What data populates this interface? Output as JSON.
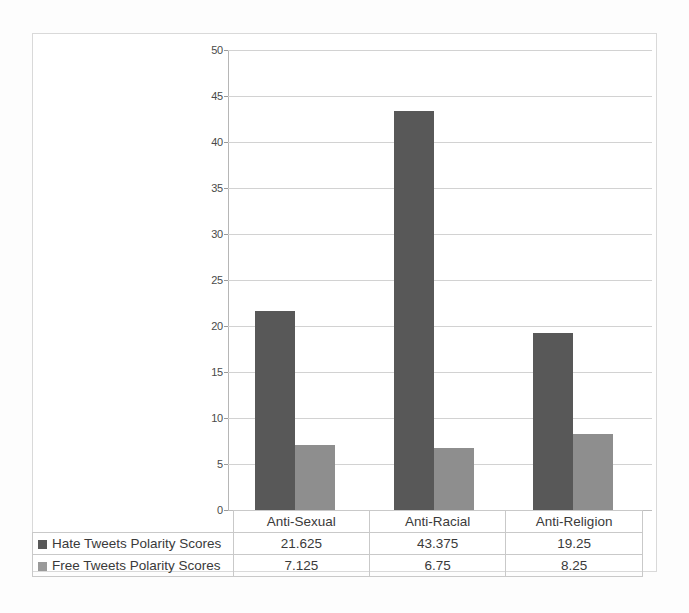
{
  "chart_data": {
    "type": "bar",
    "title": "",
    "xlabel": "",
    "ylabel": "",
    "ylim": [
      0,
      50
    ],
    "yticks": [
      0,
      5,
      10,
      15,
      20,
      25,
      30,
      35,
      40,
      45,
      50
    ],
    "grid": true,
    "legend_position": "bottom-table",
    "categories": [
      "Anti-Sexual",
      "Anti-Racial",
      "Anti-Religion"
    ],
    "series": [
      {
        "name": "Hate Tweets Polarity Scores",
        "color": "#585858",
        "values": [
          21.625,
          43.375,
          19.25
        ],
        "value_labels": [
          "21.625",
          "43.375",
          "19.25"
        ]
      },
      {
        "name": "Free Tweets Polarity Scores",
        "color": "#8e8e8e",
        "values": [
          7.125,
          6.75,
          8.25
        ],
        "value_labels": [
          "7.125",
          "6.75",
          "8.25"
        ]
      }
    ]
  },
  "axis": {
    "tick_labels": [
      "50",
      "45",
      "40",
      "35",
      "30",
      "25",
      "20",
      "15",
      "10",
      "5",
      "0"
    ]
  },
  "table": {
    "category_headers": [
      "Anti-Sexual",
      "Anti-Racial",
      "Anti-Religion"
    ],
    "rows": [
      {
        "legend": "Hate Tweets Polarity Scores",
        "swatch": "hate",
        "cells": [
          "21.625",
          "43.375",
          "19.25"
        ]
      },
      {
        "legend": "Free Tweets Polarity Scores",
        "swatch": "free",
        "cells": [
          "7.125",
          "6.75",
          "8.25"
        ]
      }
    ]
  },
  "colors": {
    "series_hate": "#585858",
    "series_free": "#8e8e8e",
    "gridline": "#d2d2d2",
    "frame": "#d9d9d9"
  }
}
